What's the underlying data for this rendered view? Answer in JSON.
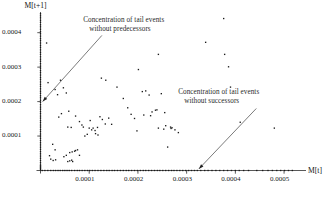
{
  "chart_data": {
    "type": "scatter",
    "title": "",
    "xlabel": "M[t]",
    "ylabel": "M[t+1]",
    "xlim": [
      -1.2e-05,
      0.000545
    ],
    "ylim": [
      -1.75e-05,
      0.00046
    ],
    "xticks": [
      0.0001,
      0.0002,
      0.0003,
      0.0004,
      0.0005
    ],
    "yticks": [
      0.0001,
      0.0002,
      0.0003,
      0.0004
    ],
    "xticklabels": [
      "0.0001",
      "0.0002",
      "0.0003",
      "0.0004",
      "0.0005"
    ],
    "yticklabels": [
      "0.0001",
      "0.0002",
      "0.0003",
      "0.0004"
    ],
    "grid": false,
    "legend": null,
    "marker": "square",
    "marker_color": "#1a1a1a",
    "annotations": [
      {
        "name": "predecessors-annotation",
        "lines": [
          "Concentration of tail events",
          "without predecessors"
        ],
        "text_x": 0.0001,
        "text_y": 0.00043,
        "arrow_from_x": 0.000126,
        "arrow_from_y": 0.000392,
        "arrow_to_x": 4.5e-06,
        "arrow_to_y": 0.0002
      },
      {
        "name": "successors-annotation",
        "lines": [
          "Concentration of tail events",
          "without successors"
        ],
        "text_x": 0.000295,
        "text_y": 0.000222,
        "arrow_from_x": 0.000443,
        "arrow_from_y": 0.00018,
        "arrow_to_x": 0.000325,
        "arrow_to_y": 4.5e-06
      }
    ],
    "series": [
      {
        "name": "tail events without predecessors (x = 0 axis cluster)",
        "points_x": [
          0,
          0,
          0,
          0,
          0,
          0,
          0,
          0,
          0,
          0,
          0,
          0,
          0,
          0,
          0,
          0,
          0,
          0,
          0,
          0,
          0,
          0,
          0,
          0,
          0,
          0,
          0,
          0,
          0,
          0,
          0,
          0,
          0,
          0,
          0,
          0,
          0,
          0,
          0,
          0,
          0,
          0,
          0,
          0,
          0,
          0,
          0,
          0,
          0,
          0,
          0,
          0,
          0,
          0,
          0,
          0,
          0,
          0,
          0,
          0,
          0,
          0,
          0,
          0,
          0,
          0,
          0,
          0,
          0,
          0,
          0,
          0
        ],
        "points_y": [
          0.000455,
          0.000449,
          0.000443,
          0.000436,
          0.00043,
          0.000423,
          0.000417,
          0.00041,
          0.000403,
          0.000397,
          0.00039,
          0.000383,
          0.000377,
          0.00037,
          0.000363,
          0.000357,
          0.00035,
          0.000343,
          0.000337,
          0.00033,
          0.000323,
          0.000317,
          0.00031,
          0.000303,
          0.000297,
          0.00029,
          0.000284,
          0.000277,
          0.00027,
          0.000264,
          0.000257,
          0.00025,
          0.000244,
          0.000237,
          0.00023,
          0.000224,
          0.000217,
          0.000211,
          0.000204,
          0.000198,
          0.000191,
          0.000184,
          0.000178,
          0.000171,
          0.000165,
          0.000158,
          0.000152,
          0.000145,
          0.000139,
          0.000132,
          0.000126,
          0.000119,
          0.000113,
          0.000106,
          0.0001,
          9.35e-05,
          8.71e-05,
          8.06e-05,
          7.42e-05,
          6.77e-05,
          6.13e-05,
          5.48e-05,
          4.84e-05,
          4.19e-05,
          3.55e-05,
          2.9e-05,
          2.26e-05,
          1.61e-05,
          1.29e-05,
          9.7e-06,
          6.5e-06,
          3.2e-06
        ]
      },
      {
        "name": "tail events without successors (y = 0 axis cluster)",
        "points_x": [
          3.6e-06,
          9e-06,
          1.5e-05,
          2.1e-05,
          2.65e-05,
          3.1e-05,
          3.6e-05,
          4.05e-05,
          4.55e-05,
          5e-05,
          5.45e-05,
          5.9e-05,
          6.4e-05,
          7e-05,
          7.55e-05,
          8e-05,
          8.55e-05,
          9.1e-05,
          9.65e-05,
          0.000101,
          0.0001065,
          0.000112,
          0.000118,
          0.000124,
          0.00013,
          0.000136,
          0.000141,
          0.000147,
          0.000152,
          0.000158,
          0.000164,
          0.00017,
          0.000176,
          0.000181,
          0.000187,
          0.000193,
          0.000199,
          0.000205,
          0.000211,
          0.000216,
          0.000222,
          0.000228,
          0.000234,
          0.00024,
          0.000245,
          0.000251,
          0.000257,
          0.000263,
          0.000269,
          0.000274,
          0.00028,
          0.000286,
          0.000292,
          0.000298,
          0.000304,
          0.00031,
          0.000316,
          0.000322,
          0.000329,
          0.000337,
          0.000344,
          0.000352,
          0.00036,
          0.000368,
          0.000376,
          0.000384,
          0.000392,
          0.0004,
          0.000408,
          0.000417,
          0.000427,
          0.000444,
          0.000456,
          0.000467,
          0.000476,
          0.000485,
          0.000493,
          0.000501,
          0.000509,
          0.000517
        ],
        "points_y": [
          0,
          0,
          0,
          0,
          0,
          0,
          0,
          0,
          0,
          0,
          0,
          0,
          0,
          0,
          0,
          0,
          0,
          0,
          0,
          0,
          0,
          0,
          0,
          0,
          0,
          0,
          0,
          0,
          0,
          0,
          0,
          0,
          0,
          0,
          0,
          0,
          0,
          0,
          0,
          0,
          0,
          0,
          0,
          0,
          0,
          0,
          0,
          0,
          0,
          0,
          0,
          0,
          0,
          0,
          0,
          0,
          0,
          0,
          0,
          0,
          0,
          0,
          0,
          0,
          0,
          0,
          0,
          0,
          0,
          0,
          0,
          0,
          0,
          0,
          0,
          0,
          0,
          0,
          0,
          0
        ]
      },
      {
        "name": "interior tail events",
        "points_x": [
          1.25e-05,
          1.55e-05,
          4.1e-05,
          3e-05,
          3.5e-05,
          4.7e-05,
          5.3e-05,
          5.8e-05,
          4.3e-05,
          3.75e-05,
          2.5e-05,
          3e-05,
          6e-05,
          6.5e-05,
          7e-05,
          7.2e-05,
          7.6e-05,
          8e-05,
          5.3e-05,
          4.8e-05,
          6.4e-05,
          6e-05,
          6.6e-05,
          1.85e-05,
          5.6e-05,
          2.1e-05,
          2.6e-05,
          3.1e-05,
          5.6e-05,
          6.3e-05,
          7.2e-05,
          8e-05,
          8.5e-05,
          8.8e-05,
          9.1e-05,
          9.6e-05,
          0.000102,
          0.000108,
          0.000113,
          0.000118,
          0.000122,
          0.000127,
          0.000133,
          0.000125,
          0.000134,
          0.00014,
          0.000146,
          0.000117,
          0.000112,
          0.0001,
          0.000105,
          0.000157,
          0.00017,
          0.000179,
          0.000186,
          0.000193,
          0.000201,
          0.000209,
          0.000216,
          0.000223,
          0.000229,
          0.000236,
          0.000242,
          0.000248,
          0.000255,
          0.000261,
          0.000268,
          0.000276,
          0.000283,
          0.000198,
          0.000212,
          0.000226,
          0.000239,
          0.000253,
          0.000267,
          0.000242,
          0.000257,
          0.00027,
          0.000339,
          0.000376,
          0.000378,
          0.000386,
          0.00039,
          0.00041,
          0.00048
        ],
        "points_y": [
          0.00037,
          0.000255,
          0.000262,
          0.000235,
          0.00022,
          0.00024,
          0.000225,
          0.000172,
          0.000165,
          0.000155,
          7.6e-05,
          6e-05,
          5.2e-05,
          5.4e-05,
          5.6e-05,
          5.8e-05,
          6e-05,
          4.4e-05,
          4.4e-05,
          4e-05,
          3e-05,
          2.8e-05,
          2.6e-05,
          4.3e-05,
          2.6e-05,
          3.3e-05,
          2.9e-05,
          3.1e-05,
          0.000126,
          0.000125,
          0.000158,
          0.000142,
          0.000132,
          0.000126,
          0.0001,
          0.000105,
          0.000145,
          0.000123,
          0.000107,
          0.000103,
          0.000156,
          0.000148,
          0.000135,
          0.000268,
          0.000262,
          0.000152,
          0.000134,
          0.000125,
          0.000116,
          0.000123,
          0.000118,
          0.000242,
          0.000209,
          0.000182,
          0.000163,
          0.000151,
          0.000293,
          0.000229,
          0.000231,
          0.000219,
          0.00017,
          0.000175,
          0.000337,
          0.000223,
          0.000168,
          6.8e-05,
          0.000122,
          0.000118,
          0.00011,
          0.000115,
          0.000161,
          0.000159,
          0.000176,
          0.00012,
          0.000126,
          0.000123,
          0.00013,
          0.000124,
          0.000372,
          0.000441,
          0.000337,
          0.000301,
          0.000242,
          0.00014,
          0.000123
        ]
      }
    ]
  },
  "axis": {
    "x_label": "M[t]",
    "y_label": "M[t+1]"
  }
}
